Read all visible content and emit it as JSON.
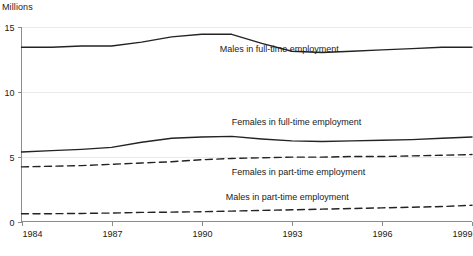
{
  "chart_data": {
    "type": "line",
    "title": "",
    "ylabel": "Millions",
    "xlabel": "",
    "ylim": [
      0,
      15
    ],
    "yticks": [
      0,
      5,
      10,
      15
    ],
    "ytick_labels": [
      "0",
      "5",
      "10",
      "15"
    ],
    "xlim": [
      1984,
      1999
    ],
    "xticks": [
      1984,
      1987,
      1990,
      1993,
      1996,
      1999
    ],
    "xtick_labels": [
      "1984",
      "1987",
      "1990",
      "1993",
      "1996",
      "1999"
    ],
    "grid": true,
    "legend_position": "inline-annotations",
    "x": [
      1984,
      1985,
      1986,
      1987,
      1988,
      1989,
      1990,
      1991,
      1992,
      1993,
      1994,
      1995,
      1996,
      1997,
      1998,
      1999
    ],
    "series": [
      {
        "name": "Males in full-time employment",
        "style": "solid",
        "label_x": 1990.6,
        "label_y": 13.05,
        "values": [
          13.4,
          13.4,
          13.5,
          13.5,
          13.8,
          14.2,
          14.4,
          14.4,
          13.7,
          13.1,
          13.0,
          13.1,
          13.2,
          13.3,
          13.4,
          13.4
        ]
      },
      {
        "name": "Females in full-time employment",
        "style": "solid",
        "label_x": 1991.0,
        "label_y": 7.4,
        "values": [
          5.35,
          5.45,
          5.55,
          5.7,
          6.1,
          6.4,
          6.5,
          6.55,
          6.35,
          6.2,
          6.15,
          6.2,
          6.25,
          6.3,
          6.4,
          6.5
        ]
      },
      {
        "name": "Females in part-time employment",
        "style": "dashed",
        "label_x": 1991.0,
        "label_y": 3.6,
        "values": [
          4.2,
          4.25,
          4.3,
          4.4,
          4.5,
          4.6,
          4.75,
          4.85,
          4.9,
          4.95,
          4.95,
          5.0,
          5.0,
          5.05,
          5.1,
          5.15
        ]
      },
      {
        "name": "Males in part-time employment",
        "style": "dashed",
        "label_x": 1990.8,
        "label_y": 1.65,
        "values": [
          0.6,
          0.6,
          0.62,
          0.65,
          0.7,
          0.72,
          0.75,
          0.8,
          0.85,
          0.9,
          0.95,
          1.0,
          1.05,
          1.1,
          1.15,
          1.25
        ]
      }
    ]
  },
  "axis": {
    "y_title": "Millions"
  },
  "colors": {
    "line": "#232323",
    "grid": "#e9e9e9",
    "axis": "#8c8c8c",
    "text": "#1a1a1a"
  }
}
